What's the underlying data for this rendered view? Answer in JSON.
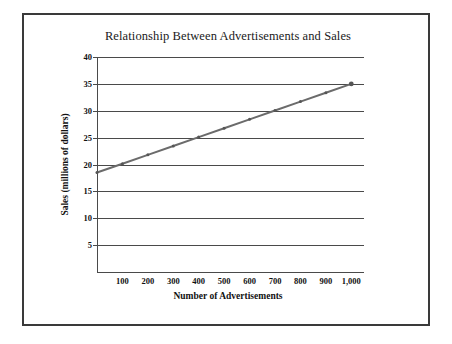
{
  "chart_data": {
    "type": "line",
    "title": "Relationship Between Advertisements and Sales",
    "xlabel": "Number of Advertisements",
    "ylabel": "Sales (millions of dollars)",
    "xlim": [
      0,
      1050
    ],
    "ylim": [
      0,
      40
    ],
    "grid": "horizontal",
    "legend": "none",
    "x_tick_labels": [
      "100",
      "200",
      "300",
      "400",
      "500",
      "600",
      "700",
      "800",
      "900",
      "1,000"
    ],
    "x_tick_values": [
      100,
      200,
      300,
      400,
      500,
      600,
      700,
      800,
      900,
      1000
    ],
    "y_tick_labels": [
      "5",
      "10",
      "15",
      "20",
      "25",
      "30",
      "35",
      "40"
    ],
    "y_tick_values": [
      5,
      10,
      15,
      20,
      25,
      30,
      35,
      40
    ],
    "series": [
      {
        "name": "Sales trend",
        "color": "#6b6b6b",
        "marker": "dot",
        "x": [
          0,
          100,
          200,
          300,
          400,
          500,
          600,
          700,
          800,
          900,
          1000
        ],
        "values": [
          18.5,
          20.15,
          21.8,
          23.45,
          25.1,
          26.75,
          28.4,
          30.05,
          31.7,
          33.35,
          35.0
        ]
      }
    ]
  },
  "frame": {
    "border_color": "#3a3a3a"
  }
}
